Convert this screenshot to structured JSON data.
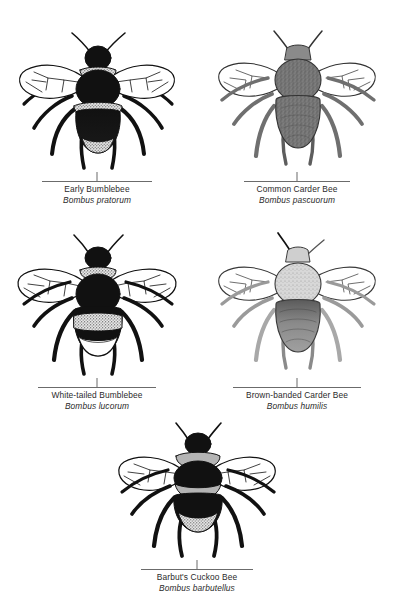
{
  "page": {
    "background_color": "#ffffff",
    "text_color": "#2b2b2b",
    "rule_color": "#6b6b6b",
    "width": 399,
    "height": 613
  },
  "species": [
    {
      "id": "early-bumblebee",
      "common_name": "Early Bumblebee",
      "scientific_name": "Bombus pratorum",
      "icon": "bee-illustration-icon",
      "body_color": "#111111",
      "band_color": "#d6d6d6",
      "wing_color": "#ffffff",
      "row": 1,
      "column": 1
    },
    {
      "id": "common-carder-bee",
      "common_name": "Common Carder Bee",
      "scientific_name": "Bombus pascuorum",
      "icon": "bee-illustration-icon",
      "body_color": "#6f6f6f",
      "band_color": "#8a8a8a",
      "wing_color": "#ffffff",
      "row": 1,
      "column": 2
    },
    {
      "id": "white-tailed-bumblebee",
      "common_name": "White-tailed Bumblebee",
      "scientific_name": "Bombus lucorum",
      "icon": "bee-illustration-icon",
      "body_color": "#111111",
      "band_color": "#dddddd",
      "wing_color": "#ffffff",
      "row": 2,
      "column": 1
    },
    {
      "id": "brown-banded-carder-bee",
      "common_name": "Brown-banded Carder Bee",
      "scientific_name": "Bombus humilis",
      "icon": "bee-illustration-icon",
      "body_color": "#8d8d8d",
      "band_color": "#d2d2d2",
      "wing_color": "#ffffff",
      "row": 2,
      "column": 2
    },
    {
      "id": "barbuts-cuckoo-bee",
      "common_name": "Barbut's Cuckoo Bee",
      "scientific_name": "Bombus barbutellus",
      "icon": "bee-illustration-icon",
      "body_color": "#111111",
      "band_color": "#bcbcbc",
      "wing_color": "#ffffff",
      "row": 3,
      "column": 1
    }
  ]
}
